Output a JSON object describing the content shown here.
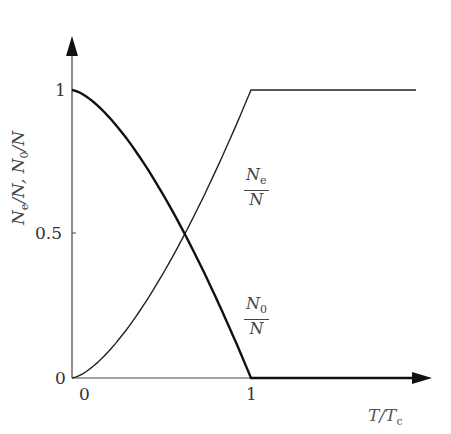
{
  "chart_data": {
    "type": "line",
    "title": "",
    "xlabel": "T/Tc",
    "ylabel": "Ne/N, N0/N",
    "xlim": [
      0,
      2
    ],
    "ylim": [
      0,
      1.2
    ],
    "x_ticks": [
      "0",
      "1"
    ],
    "y_ticks": [
      "0",
      "0.5",
      "1"
    ],
    "grid": false,
    "series": [
      {
        "name": "Ne/N",
        "x": [
          0,
          0.2,
          0.4,
          0.6,
          0.63,
          0.8,
          1.0,
          1.2,
          1.4,
          1.6,
          1.85
        ],
        "y": [
          0,
          0.09,
          0.25,
          0.46,
          0.5,
          0.72,
          1.0,
          1.0,
          1.0,
          1.0,
          1.0
        ]
      },
      {
        "name": "N0/N",
        "x": [
          0,
          0.2,
          0.4,
          0.6,
          0.63,
          0.8,
          1.0,
          1.2,
          1.4,
          1.6,
          2.0
        ],
        "y": [
          1,
          0.91,
          0.75,
          0.54,
          0.5,
          0.28,
          0,
          0,
          0,
          0,
          0
        ]
      }
    ],
    "annotations": [
      {
        "text": "Ne/N",
        "near": "rising curve"
      },
      {
        "text": "N0/N",
        "near": "falling curve"
      }
    ]
  },
  "labels": {
    "y_tick_1": "1",
    "y_tick_05": "0.5",
    "y_tick_0": "0",
    "x_tick_0": "0",
    "x_tick_1": "1",
    "x_axis_T": "T/T",
    "x_axis_sub": "c",
    "ne_num": "N",
    "ne_sub": "e",
    "ne_den": "N",
    "n0_num": "N",
    "n0_sub": "0",
    "n0_den": "N",
    "y_axis": "N",
    "y_axis_sub1": "e",
    "y_axis_mid": "/N, N",
    "y_axis_sub2": "0",
    "y_axis_end": "/N"
  }
}
